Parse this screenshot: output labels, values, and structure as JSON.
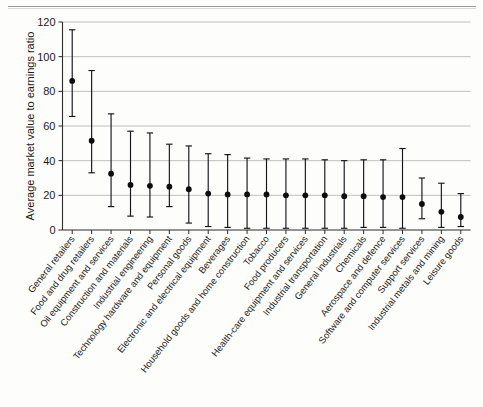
{
  "chart_data": {
    "type": "scatter",
    "title": "",
    "xlabel": "",
    "ylabel": "Average market value to earnings ratio",
    "ylim": [
      0,
      120
    ],
    "yticks": [
      0,
      20,
      40,
      60,
      80,
      100,
      120
    ],
    "grid": true,
    "legend": "none",
    "error_type": "range (upper and lower bounds)",
    "categories": [
      "General retailers",
      "Food and drug retailers",
      "Oil equipment and services",
      "Construction and materials",
      "Industrial engineering",
      "Technology hardware and equipment",
      "Personal goods",
      "Electronic and electrical equipment",
      "Beverages",
      "Household goods and home construction",
      "Tobacco",
      "Food producers",
      "Health-care equipment and services",
      "Industrial transportation",
      "General industrials",
      "Chemicals",
      "Aerospace and defence",
      "Software and computer services",
      "Support services",
      "Industrial metals and mining",
      "Leisure goods"
    ],
    "values": [
      86,
      51.5,
      32.5,
      26,
      25.5,
      25,
      23.5,
      21,
      20.5,
      20.5,
      20.5,
      20,
      20,
      20,
      19.5,
      19.5,
      19,
      19,
      15,
      10.5,
      7.5
    ],
    "upper": [
      115.5,
      92,
      67,
      57,
      56,
      49.5,
      48.5,
      44,
      43.5,
      41.5,
      41,
      41,
      41,
      40.5,
      40,
      40.5,
      40.5,
      47,
      30,
      27,
      21
    ],
    "lower": [
      65.5,
      33,
      13.5,
      8,
      7.5,
      13.5,
      4,
      2,
      1.5,
      1,
      1,
      1,
      1,
      1,
      1,
      1.5,
      1.5,
      1,
      6.5,
      1.5,
      2
    ]
  },
  "figure": {
    "ylabel": "Average market value to earnings ratio"
  }
}
